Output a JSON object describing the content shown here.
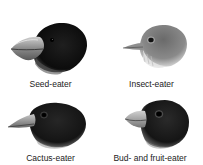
{
  "figure": {
    "panels": [
      {
        "id": "seed",
        "label": "Seed-eater",
        "beak": "large thick crushing beak",
        "plumage": "black"
      },
      {
        "id": "insect",
        "label": "Insect-eater",
        "beak": "thin pointed beak",
        "plumage": "grey-brown"
      },
      {
        "id": "cactus",
        "label": "Cactus-eater",
        "beak": "long pointed probing beak",
        "plumage": "black"
      },
      {
        "id": "bud",
        "label": "Bud- and fruit-eater",
        "beak": "short thick grasping beak",
        "plumage": "black"
      }
    ]
  },
  "colors": {
    "background": "#ffffff",
    "dark_plumage": "#141414",
    "grey_plumage": "#7d7d7d",
    "beak": "#9a9a9a",
    "label": "#222222"
  }
}
